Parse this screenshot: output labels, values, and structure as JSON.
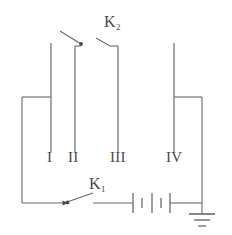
{
  "figure": {
    "type": "electrical-circuit-diagram",
    "width": 232,
    "height": 235,
    "background_color": "#ffffff",
    "line_color": "#6a6a6a",
    "text_color": "#4a4a4a",
    "line_width": 1.1
  },
  "electrodes": [
    {
      "id": "electrode-1",
      "label": "I",
      "x": 51,
      "top_y": 43,
      "bottom_y": 152
    },
    {
      "id": "electrode-2",
      "label": "II",
      "x": 75,
      "top_y": 46,
      "bottom_y": 152
    },
    {
      "id": "electrode-3",
      "label": "III",
      "x": 118,
      "top_y": 46,
      "bottom_y": 152
    },
    {
      "id": "electrode-4",
      "label": "IV",
      "x": 174,
      "top_y": 43,
      "bottom_y": 152
    }
  ],
  "electrode_labels": [
    {
      "text": "I",
      "x": 47,
      "y": 158
    },
    {
      "text": "II",
      "x": 68,
      "y": 158
    },
    {
      "text": "III",
      "x": 109,
      "y": 158
    },
    {
      "text": "IV",
      "x": 166,
      "y": 158
    }
  ],
  "switches": [
    {
      "id": "switch-k2",
      "label": "K",
      "subscript": "2",
      "state": "open",
      "position": "top",
      "label_x": 104,
      "label_y": 16,
      "pivot_x": 81,
      "pivot_y": 45,
      "lever_end_x": 61,
      "lever_end_y": 32,
      "contact_x": 118,
      "contact_y": 46
    },
    {
      "id": "switch-k1",
      "label": "K",
      "subscript": "1",
      "state": "open",
      "position": "bottom",
      "label_x": 89,
      "label_y": 178,
      "pivot_x": 67,
      "pivot_y": 203,
      "lever_end_x": 92,
      "lever_end_y": 193,
      "contact_x": 98,
      "contact_y": 203
    }
  ],
  "battery": {
    "id": "battery",
    "cells": 2,
    "x_start": 133,
    "x_end": 170,
    "y": 203,
    "plates": [
      {
        "type": "long",
        "x": 133,
        "half_height": 10
      },
      {
        "type": "short",
        "x": 142,
        "half_height": 5
      },
      {
        "type": "long",
        "x": 152,
        "half_height": 10
      },
      {
        "type": "short",
        "x": 161,
        "half_height": 5
      },
      {
        "type": "long",
        "x": 170,
        "half_height": 10
      }
    ]
  },
  "ground": {
    "id": "ground-symbol",
    "x": 202,
    "stem_top_y": 203,
    "stem_bottom_y": 214,
    "bars": [
      {
        "half_width": 13,
        "y": 214
      },
      {
        "half_width": 8,
        "y": 220
      },
      {
        "half_width": 4,
        "y": 226
      }
    ]
  },
  "wires": [
    {
      "id": "wire-electrode1-to-left",
      "points": "51,97 22,97"
    },
    {
      "id": "wire-left-vertical",
      "points": "22,97 22,203"
    },
    {
      "id": "wire-bottom-left-to-k1",
      "points": "22,203 67,203"
    },
    {
      "id": "wire-k1-to-battery",
      "points": "98,203 133,203"
    },
    {
      "id": "wire-battery-to-ground",
      "points": "170,203 202,203"
    },
    {
      "id": "wire-electrode4-to-right",
      "points": "174,97 202,97"
    },
    {
      "id": "wire-right-vertical",
      "points": "202,97 202,203"
    },
    {
      "id": "wire-k2-bracket-left",
      "points": "75,46 81,46"
    },
    {
      "id": "wire-k2-bracket-right",
      "points": "118,46 118,46"
    }
  ],
  "arrows": [
    {
      "id": "arrow-k2-pivot",
      "x": 81,
      "y": 45,
      "direction": "right"
    },
    {
      "id": "arrow-k1-pivot",
      "x": 67,
      "y": 203,
      "direction": "right"
    }
  ]
}
